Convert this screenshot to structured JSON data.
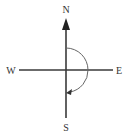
{
  "diagram": {
    "type": "compass-rotation",
    "labels": {
      "north": "N",
      "south": "S",
      "east": "E",
      "west": "W"
    },
    "rotation": {
      "direction": "clockwise",
      "from": "N",
      "to": "S",
      "angle_degrees": 180
    },
    "colors": {
      "axis": "#3a3a3a",
      "arc": "#666666",
      "text": "#333333"
    }
  }
}
